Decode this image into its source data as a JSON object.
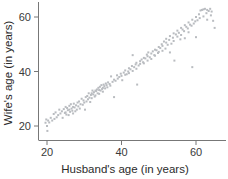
{
  "chart_data": {
    "type": "scatter",
    "title": "",
    "xlabel": "Husband's age (in years)",
    "ylabel": "Wife's age (in years)",
    "xlim": [
      14,
      68
    ],
    "ylim": [
      14,
      66
    ],
    "xticks": [
      20,
      40,
      60
    ],
    "yticks": [
      20,
      40,
      60
    ],
    "xtick_labels": [
      "20",
      "40",
      "60"
    ],
    "ytick_labels": [
      "20",
      "40",
      "60"
    ],
    "grid": false,
    "legend": null,
    "marker": "square",
    "marker_color": "#b9bcc0",
    "marker_size": 2,
    "series": [
      {
        "name": "couples",
        "points": [
          [
            19.6,
            21.2
          ],
          [
            19.8,
            22.4
          ],
          [
            20.0,
            20.0
          ],
          [
            20.1,
            18.2
          ],
          [
            20.3,
            22.0
          ],
          [
            20.6,
            21.3
          ],
          [
            21.0,
            23.0
          ],
          [
            21.4,
            22.0
          ],
          [
            21.8,
            24.4
          ],
          [
            22.0,
            22.6
          ],
          [
            22.3,
            25.0
          ],
          [
            22.6,
            23.2
          ],
          [
            23.0,
            24.0
          ],
          [
            23.3,
            26.0
          ],
          [
            23.6,
            24.6
          ],
          [
            24.0,
            25.4
          ],
          [
            24.2,
            23.0
          ],
          [
            24.5,
            26.2
          ],
          [
            24.8,
            24.8
          ],
          [
            25.0,
            25.0
          ],
          [
            25.0,
            27.0
          ],
          [
            25.2,
            24.2
          ],
          [
            25.4,
            26.6
          ],
          [
            25.6,
            25.8
          ],
          [
            25.8,
            24.0
          ],
          [
            26.0,
            26.0
          ],
          [
            26.0,
            27.4
          ],
          [
            26.2,
            25.2
          ],
          [
            26.4,
            28.0
          ],
          [
            26.6,
            26.4
          ],
          [
            26.8,
            25.6
          ],
          [
            27.0,
            27.0
          ],
          [
            27.0,
            24.6
          ],
          [
            27.2,
            28.2
          ],
          [
            27.4,
            26.8
          ],
          [
            27.6,
            25.4
          ],
          [
            27.8,
            27.6
          ],
          [
            28.0,
            26.0
          ],
          [
            28.2,
            28.6
          ],
          [
            28.4,
            27.2
          ],
          [
            28.6,
            29.0
          ],
          [
            28.8,
            26.4
          ],
          [
            29.0,
            28.0
          ],
          [
            29.3,
            30.0
          ],
          [
            29.6,
            27.8
          ],
          [
            29.8,
            29.4
          ],
          [
            30.0,
            28.6
          ],
          [
            30.2,
            26.0
          ],
          [
            30.4,
            30.6
          ],
          [
            30.6,
            29.0
          ],
          [
            30.8,
            31.0
          ],
          [
            31.0,
            29.8
          ],
          [
            31.2,
            32.0
          ],
          [
            31.4,
            30.4
          ],
          [
            31.6,
            28.8
          ],
          [
            31.8,
            31.4
          ],
          [
            32.0,
            32.0
          ],
          [
            32.0,
            30.2
          ],
          [
            32.2,
            33.0
          ],
          [
            32.4,
            31.6
          ],
          [
            32.6,
            32.4
          ],
          [
            32.8,
            30.8
          ],
          [
            33.0,
            33.0
          ],
          [
            33.0,
            31.2
          ],
          [
            33.2,
            32.8
          ],
          [
            33.4,
            33.4
          ],
          [
            33.6,
            32.0
          ],
          [
            33.8,
            34.0
          ],
          [
            34.0,
            33.2
          ],
          [
            34.0,
            31.8
          ],
          [
            34.2,
            34.4
          ],
          [
            34.4,
            33.0
          ],
          [
            34.6,
            35.0
          ],
          [
            34.8,
            33.6
          ],
          [
            35.0,
            34.0
          ],
          [
            35.0,
            32.6
          ],
          [
            35.2,
            35.2
          ],
          [
            35.4,
            34.6
          ],
          [
            35.6,
            33.8
          ],
          [
            35.8,
            35.6
          ],
          [
            36.0,
            35.0
          ],
          [
            36.2,
            34.2
          ],
          [
            36.4,
            36.0
          ],
          [
            36.8,
            35.4
          ],
          [
            37.0,
            34.8
          ],
          [
            37.2,
            38.2
          ],
          [
            37.6,
            36.2
          ],
          [
            38.0,
            37.0
          ],
          [
            38.0,
            30.6
          ],
          [
            38.4,
            36.6
          ],
          [
            38.8,
            38.6
          ],
          [
            39.0,
            37.4
          ],
          [
            39.4,
            38.0
          ],
          [
            39.8,
            39.2
          ],
          [
            40.0,
            38.4
          ],
          [
            40.2,
            36.8
          ],
          [
            40.6,
            39.6
          ],
          [
            41.0,
            38.8
          ],
          [
            41.0,
            40.4
          ],
          [
            41.4,
            39.0
          ],
          [
            41.8,
            40.0
          ],
          [
            42.0,
            41.2
          ],
          [
            42.0,
            39.4
          ],
          [
            42.4,
            40.8
          ],
          [
            42.8,
            42.0
          ],
          [
            43.0,
            40.2
          ],
          [
            43.0,
            46.0
          ],
          [
            43.4,
            41.6
          ],
          [
            43.8,
            42.6
          ],
          [
            44.0,
            41.0
          ],
          [
            44.0,
            43.2
          ],
          [
            44.2,
            35.2
          ],
          [
            44.6,
            42.2
          ],
          [
            45.0,
            43.8
          ],
          [
            45.0,
            42.8
          ],
          [
            45.4,
            44.4
          ],
          [
            45.8,
            43.4
          ],
          [
            46.0,
            45.0
          ],
          [
            46.0,
            43.0
          ],
          [
            46.4,
            44.8
          ],
          [
            46.8,
            46.2
          ],
          [
            47.0,
            44.0
          ],
          [
            47.0,
            45.6
          ],
          [
            47.2,
            47.0
          ],
          [
            47.6,
            45.2
          ],
          [
            48.0,
            46.6
          ],
          [
            48.0,
            44.6
          ],
          [
            48.4,
            47.4
          ],
          [
            48.8,
            46.0
          ],
          [
            49.0,
            48.0
          ],
          [
            49.0,
            45.8
          ],
          [
            49.4,
            47.8
          ],
          [
            49.8,
            46.8
          ],
          [
            50.0,
            49.0
          ],
          [
            50.0,
            47.2
          ],
          [
            50.4,
            48.6
          ],
          [
            50.8,
            50.0
          ],
          [
            51.0,
            47.6
          ],
          [
            51.0,
            49.4
          ],
          [
            51.4,
            51.0
          ],
          [
            51.8,
            48.4
          ],
          [
            52.0,
            50.6
          ],
          [
            52.0,
            52.0
          ],
          [
            52.4,
            49.8
          ],
          [
            52.8,
            51.6
          ],
          [
            53.0,
            47.0
          ],
          [
            53.0,
            53.0
          ],
          [
            53.4,
            50.2
          ],
          [
            53.8,
            52.4
          ],
          [
            54.0,
            54.0
          ],
          [
            54.0,
            51.2
          ],
          [
            54.2,
            44.0
          ],
          [
            54.6,
            53.6
          ],
          [
            55.0,
            52.8
          ],
          [
            55.0,
            55.0
          ],
          [
            55.4,
            54.2
          ],
          [
            55.8,
            51.8
          ],
          [
            56.0,
            56.0
          ],
          [
            56.0,
            53.4
          ],
          [
            56.4,
            55.4
          ],
          [
            56.8,
            54.8
          ],
          [
            57.0,
            57.0
          ],
          [
            57.0,
            52.2
          ],
          [
            57.4,
            56.4
          ],
          [
            57.8,
            55.8
          ],
          [
            58.0,
            58.0
          ],
          [
            58.0,
            54.4
          ],
          [
            58.4,
            57.2
          ],
          [
            58.8,
            56.8
          ],
          [
            59.0,
            41.6
          ],
          [
            59.0,
            59.0
          ],
          [
            59.4,
            57.6
          ],
          [
            59.8,
            58.4
          ],
          [
            60.0,
            52.6
          ],
          [
            60.0,
            60.0
          ],
          [
            60.4,
            58.8
          ],
          [
            60.8,
            61.0
          ],
          [
            61.0,
            59.6
          ],
          [
            61.2,
            62.4
          ],
          [
            61.6,
            62.6
          ],
          [
            62.0,
            60.2
          ],
          [
            62.0,
            62.8
          ],
          [
            62.4,
            63.0
          ],
          [
            62.8,
            61.4
          ],
          [
            63.0,
            62.6
          ],
          [
            63.0,
            59.0
          ],
          [
            63.4,
            62.2
          ],
          [
            63.8,
            63.0
          ],
          [
            64.0,
            60.6
          ],
          [
            64.2,
            62.0
          ],
          [
            64.6,
            58.6
          ],
          [
            65.0,
            56.0
          ]
        ]
      }
    ]
  },
  "axis": {
    "x_title": "Husband's age (in years)",
    "y_title": "Wife's age (in years)",
    "x_tick_0": "20",
    "x_tick_1": "40",
    "x_tick_2": "60",
    "y_tick_0": "20",
    "y_tick_1": "40",
    "y_tick_2": "60"
  },
  "colors": {
    "marker": "#b9bcc0",
    "axis": "#777777",
    "text": "#2b2b2b"
  }
}
